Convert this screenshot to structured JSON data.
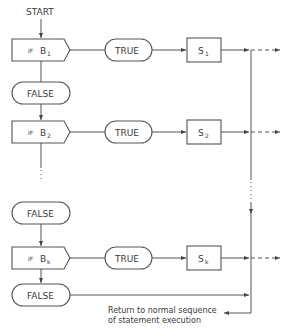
{
  "diagram": {
    "start_label": "START",
    "conditions": [
      {
        "if_prefix": "IF",
        "var": "B",
        "sub": "1",
        "true_label": "TRUE",
        "stmt": "S",
        "stmt_sub": "1",
        "false_label": "FALSE"
      },
      {
        "if_prefix": "IF",
        "var": "B",
        "sub": "2",
        "true_label": "TRUE",
        "stmt": "S",
        "stmt_sub": "2",
        "false_label": "FALSE"
      },
      {
        "if_prefix": "IF",
        "var": "B",
        "sub": "k",
        "true_label": "TRUE",
        "stmt": "S",
        "stmt_sub": "k",
        "false_label": "FALSE"
      }
    ],
    "return_note": {
      "line1": "Return to normal sequence",
      "line2": "of statement execution"
    }
  }
}
